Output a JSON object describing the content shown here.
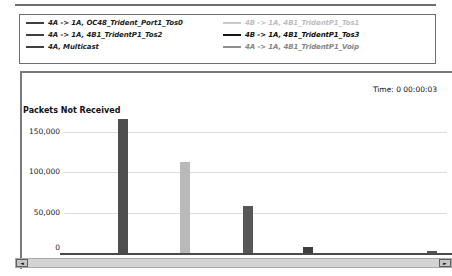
{
  "legend": {
    "items": [
      {
        "label": "4A -> 1A, OC48_Trident_Port1_Tos0",
        "line_color": "#3f3f3f",
        "text_color": "#1c1c1c"
      },
      {
        "label": "4B -> 1A, 4B1_TridentP1_Tos1",
        "line_color": "#c9c9c9",
        "text_color": "#bdbdbd"
      },
      {
        "label": "4A -> 1A, 4B1_TridentP1_Tos2",
        "line_color": "#3f3f3f",
        "text_color": "#1c1c1c"
      },
      {
        "label": "4B -> 1A, 4B1_TridentP1_Tos3",
        "line_color": "#161616",
        "text_color": "#0d0d0d"
      },
      {
        "label": "4A, Multicast",
        "line_color": "#3f3f3f",
        "text_color": "#1c1c1c"
      },
      {
        "label": "4A -> 1A, 4B1_TridentP1_Voip",
        "line_color": "#8f8f8f",
        "text_color": "#858585"
      }
    ]
  },
  "chart": {
    "time_label": "Time: 0 00:00:03",
    "y_axis_title": "Packets Not Received",
    "y_ticks": [
      {
        "label": "150,000",
        "value": 150000
      },
      {
        "label": "100,000",
        "value": 100000
      },
      {
        "label": "50,000",
        "value": 50000
      },
      {
        "label": "0",
        "value": 0
      }
    ]
  },
  "scrollbar": {
    "left_arrow": "◄",
    "right_arrow": "►"
  },
  "chart_data": {
    "type": "bar",
    "title": "Packets Not Received",
    "xlabel": "",
    "ylabel": "Packets Not Received",
    "ylim": [
      0,
      175000
    ],
    "grid": true,
    "gridline_values": [
      50000,
      100000,
      150000
    ],
    "legend_position": "top",
    "time": "0 00:00:03",
    "categories": [
      "4A -> 1A, OC48_Trident_Port1_Tos0",
      "4B -> 1A, 4B1_TridentP1_Tos1",
      "4A -> 1A, 4B1_TridentP1_Tos2",
      "4B -> 1A, 4B1_TridentP1_Tos3",
      "4A, Multicast",
      "4A -> 1A, 4B1_TridentP1_Voip"
    ],
    "values": [
      165000,
      112000,
      58000,
      7000,
      0,
      2000
    ],
    "bar_colors": [
      "#4e4e4e",
      "#b9b9b9",
      "#575757",
      "#3e3e3e",
      "#4e4e4e",
      "#555555"
    ]
  }
}
